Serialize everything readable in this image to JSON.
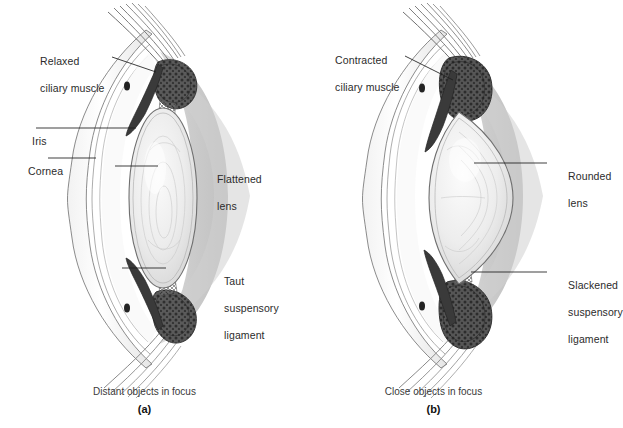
{
  "figure": {
    "panels": [
      {
        "id": "a",
        "caption": "Distant objects in focus",
        "letter": "(a)",
        "labels": [
          {
            "name": "relaxed-ciliary-muscle",
            "line1": "Relaxed",
            "line2": "ciliary muscle",
            "line3": ""
          },
          {
            "name": "iris",
            "line1": "Iris",
            "line2": "",
            "line3": ""
          },
          {
            "name": "cornea",
            "line1": "Cornea",
            "line2": "",
            "line3": ""
          },
          {
            "name": "flattened-lens",
            "line1": "Flattened",
            "line2": "lens",
            "line3": ""
          },
          {
            "name": "taut-suspensory-ligament",
            "line1": "Taut",
            "line2": "suspensory",
            "line3": "ligament"
          }
        ]
      },
      {
        "id": "b",
        "caption": "Close objects in focus",
        "letter": "(b)",
        "labels": [
          {
            "name": "contracted-ciliary-muscle",
            "line1": "Contracted",
            "line2": "ciliary muscle",
            "line3": ""
          },
          {
            "name": "rounded-lens",
            "line1": "Rounded",
            "line2": "lens",
            "line3": ""
          },
          {
            "name": "slackened-suspensory-ligament",
            "line1": "Slackened",
            "line2": "suspensory",
            "line3": "ligament"
          }
        ]
      }
    ],
    "colors": {
      "background": "#ffffff",
      "label_text": "#2b2b2b",
      "leader_line": "#1d1d1d",
      "sclera": "#fdfdfd",
      "vitreous": "#c6c6c6",
      "iris_dark": "#3d3d3d",
      "ciliary_body": "#4a4a4a",
      "lens_fill": "#ededed",
      "outline": "#5a5a5a"
    }
  }
}
